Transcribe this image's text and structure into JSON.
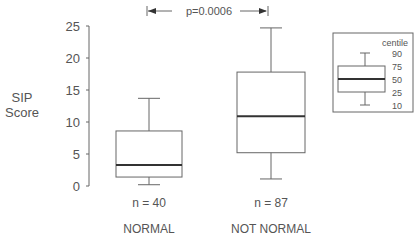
{
  "chart_data": {
    "type": "boxplot",
    "title": "",
    "ylabel": "SIP Score",
    "xlabel": "",
    "ylim": [
      0,
      25
    ],
    "yticks": [
      0,
      5,
      10,
      15,
      20,
      25
    ],
    "grid": false,
    "categories": [
      "NORMAL",
      "NOT NORMAL"
    ],
    "series": [
      {
        "name": "NORMAL",
        "n_label": "n = 40",
        "p10": 0.2,
        "p25": 1.4,
        "p50": 3.3,
        "p75": 8.6,
        "p90": 13.7
      },
      {
        "name": "NOT NORMAL",
        "n_label": "n = 87",
        "p10": 1.1,
        "p25": 5.2,
        "p50": 10.9,
        "p75": 17.8,
        "p90": 24.7
      }
    ],
    "annotation": {
      "text": "p=0.0006",
      "between": [
        "NORMAL",
        "NOT NORMAL"
      ]
    },
    "legend": {
      "placement": "top-right",
      "title": "centile",
      "labels": [
        "90",
        "75",
        "50",
        "25",
        "10"
      ]
    }
  }
}
